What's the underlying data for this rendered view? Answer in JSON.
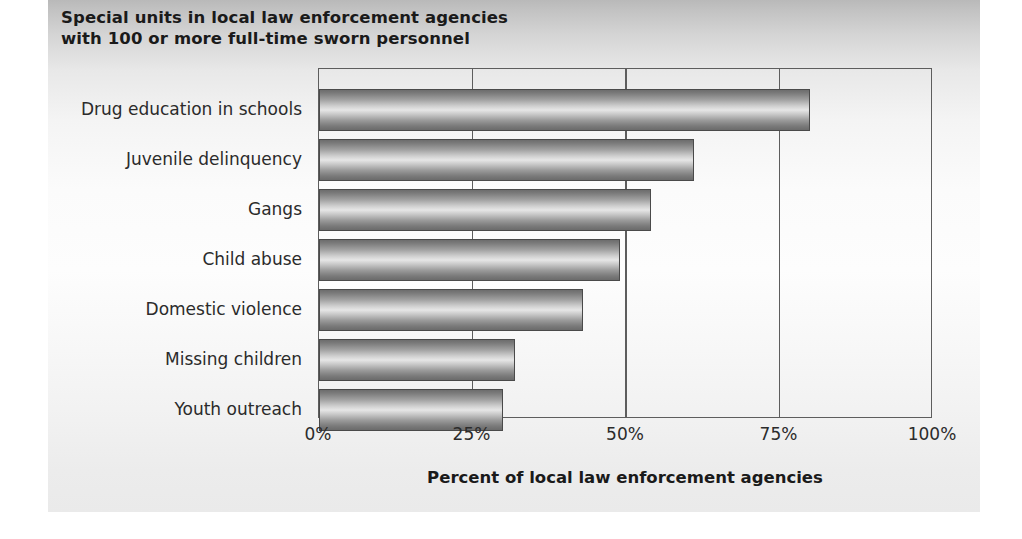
{
  "chart_data": {
    "type": "bar",
    "orientation": "horizontal",
    "title": "Special units in local law enforcement agencies with 100 or more full-time sworn personnel",
    "title_lines": [
      "Special units in local law enforcement agencies",
      "with 100 or more full-time sworn personnel"
    ],
    "categories": [
      "Drug education in schools",
      "Juvenile delinquency",
      "Gangs",
      "Child abuse",
      "Domestic violence",
      "Missing children",
      "Youth outreach"
    ],
    "values": [
      80,
      61,
      54,
      49,
      43,
      32,
      30
    ],
    "xlabel": "Percent of local law enforcement agencies",
    "ylabel": "",
    "xlim": [
      0,
      100
    ],
    "xticks": [
      0,
      25,
      50,
      75,
      100
    ],
    "xtick_labels": [
      "0%",
      "25%",
      "50%",
      "75%",
      "100%"
    ],
    "grid": true,
    "grid_axis": "x",
    "legend": false,
    "bar_style": "gradient-cylinder-grayscale",
    "colors": {
      "bar_edge": "#4a4a4a",
      "bar_light": "#e6e6e6",
      "bar_dark": "#6d6d6d",
      "axis": "#5d5d5d",
      "text": "#2b2b2b",
      "title_text": "#1a1a1a",
      "panel_background": "#f4f4f4"
    }
  }
}
